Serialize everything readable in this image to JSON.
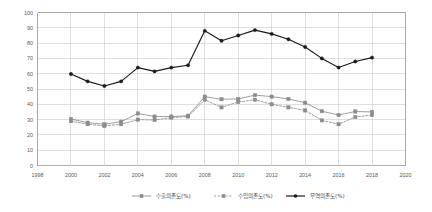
{
  "chart_data": {
    "type": "line",
    "title": "",
    "subtitle": "",
    "xlabel": "",
    "ylabel": "",
    "xlim": [
      1998,
      2020
    ],
    "ylim": [
      0,
      100
    ],
    "xticks": [
      1998,
      2000,
      2002,
      2004,
      2006,
      2008,
      2010,
      2012,
      2014,
      2016,
      2018,
      2020
    ],
    "yticks": [
      0,
      10,
      20,
      30,
      40,
      50,
      60,
      70,
      80,
      90,
      100
    ],
    "xtick_labels": [
      "1998",
      "2000",
      "2002",
      "2004",
      "2006",
      "2008",
      "2010",
      "2012",
      "2014",
      "2016",
      "2018",
      "2020"
    ],
    "ytick_labels": [
      "0",
      "10",
      "20",
      "30",
      "40",
      "50",
      "60",
      "70",
      "80",
      "90",
      "100"
    ],
    "grid": true,
    "grid_color": "#c9c9c9",
    "legend_position": "bottom",
    "x": [
      2000,
      2001,
      2002,
      2003,
      2004,
      2005,
      2006,
      2007,
      2008,
      2009,
      2010,
      2011,
      2012,
      2013,
      2014,
      2015,
      2016,
      2017,
      2018
    ],
    "series": [
      {
        "name": "수출의존도(%)",
        "color": "#8c8c8c",
        "marker": "square",
        "linestyle": "solid",
        "values": [
          30.4,
          28.0,
          27.0,
          28.6,
          34.0,
          32.0,
          32.0,
          32.5,
          45.0,
          43.3,
          43.5,
          46.0,
          45.0,
          43.5,
          41.0,
          35.5,
          33.0,
          35.3,
          35.0
        ]
      },
      {
        "name": "수입의존도(%)",
        "color": "#8c8c8c",
        "marker": "square",
        "linestyle": "dashed",
        "values": [
          29.0,
          27.0,
          25.8,
          27.0,
          30.0,
          29.7,
          31.3,
          32.0,
          43.0,
          38.0,
          41.5,
          43.0,
          40.0,
          38.0,
          36.0,
          29.5,
          27.0,
          31.7,
          33.0
        ]
      },
      {
        "name": "무역의존도(%)",
        "color": "#1a1a1a",
        "marker": "circle",
        "linestyle": "solid",
        "values": [
          59.8,
          55.0,
          52.0,
          55.0,
          64.0,
          61.5,
          64.0,
          65.5,
          88.0,
          81.5,
          85.0,
          88.5,
          86.0,
          82.5,
          77.5,
          70.0,
          64.0,
          68.0,
          70.5
        ]
      }
    ]
  },
  "legend": {
    "items": [
      {
        "label": "수출의존도(%)",
        "color": "#8c8c8c",
        "style": "solid"
      },
      {
        "label": "수입의존도(%)",
        "color": "#8c8c8c",
        "style": "dashed"
      },
      {
        "label": "무역의존도(%)",
        "color": "#1a1a1a",
        "style": "solid"
      }
    ]
  }
}
